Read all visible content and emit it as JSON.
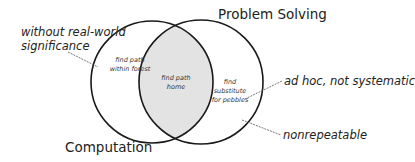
{
  "diagram": {
    "type": "venn",
    "colors": {
      "stroke": "#1a1a1a",
      "intersection_fill": "#e3e3e3",
      "leader_line": "#555555",
      "background": "#ffffff"
    },
    "sets": [
      {
        "id": "computation",
        "label": "Computation",
        "cx": 152,
        "cy": 82,
        "r": 61
      },
      {
        "id": "problem_solving",
        "label": "Problem Solving",
        "cx": 201,
        "cy": 82,
        "r": 62
      }
    ],
    "regions": {
      "computation_only": {
        "line1": "find path",
        "line2": "within forest"
      },
      "intersection": {
        "line1": "find path",
        "line2": "home"
      },
      "problem_solving_only": {
        "line1": "find",
        "line2": "substitute",
        "line3": "for pebbles"
      }
    },
    "annotations": [
      {
        "id": "without_significance",
        "line1": "without real-world",
        "line2": "significance",
        "points_to": "computation_only"
      },
      {
        "id": "ad_hoc",
        "text": "ad hoc, not systematic",
        "points_to": "problem_solving_only"
      },
      {
        "id": "nonrepeatable",
        "text": "nonrepeatable",
        "points_to": "problem_solving_only"
      }
    ]
  }
}
